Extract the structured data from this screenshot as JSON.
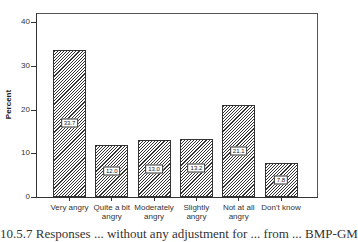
{
  "chart_data": {
    "type": "bar",
    "title": "",
    "xlabel": "",
    "ylabel": "Percent",
    "ylim": [
      0,
      40
    ],
    "yticks": [
      0,
      10,
      20,
      30,
      40
    ],
    "grid": false,
    "categories": [
      "Very angry",
      "Quite a bit angry",
      "Moderately angry",
      "Slightly angry",
      "Not at all angry",
      "Don't know"
    ],
    "values": [
      33.7,
      12.0,
      13.0,
      13.2,
      21.1,
      7.8
    ],
    "data_labels": [
      "33.7",
      "12.0",
      "13.0",
      "13.2",
      "21.1",
      "7.8"
    ],
    "fill": "diagonal-hatch"
  },
  "axis": {
    "ylabel": "Percent",
    "yticks": [
      "0",
      "10",
      "20",
      "30",
      "40"
    ]
  },
  "categories_display": [
    [
      "Very angry"
    ],
    [
      "Quite a bit",
      "angry"
    ],
    [
      "Moderately",
      "angry"
    ],
    [
      "Slightly angry"
    ],
    [
      "Not at all",
      "angry"
    ],
    [
      "Don't know"
    ]
  ],
  "caption": "10.5.7  Responses ... without any adjustment for ... from ... BMP-GM"
}
